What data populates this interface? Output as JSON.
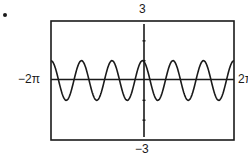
{
  "labels": {
    "y_max": "3",
    "y_min": "−3",
    "x_min": "−2π",
    "x_max": "2π"
  },
  "chart_data": {
    "type": "line",
    "title": "",
    "function": "y = cos(3x)",
    "xlabel": "",
    "ylabel": "",
    "xlim": [
      -6.2832,
      6.2832
    ],
    "ylim": [
      -3,
      3
    ],
    "x_tick_labels": [
      "−2π",
      "2π"
    ],
    "y_tick_labels": [
      "3",
      "−3"
    ],
    "y_ticks": [
      -2,
      -1,
      1,
      2
    ],
    "grid": false,
    "legend": null,
    "series": [
      {
        "name": "cos(3x)",
        "amplitude": 1,
        "period": 2.0944,
        "x": [
          -6.2832,
          -5.236,
          -4.1888,
          -3.1416,
          -2.0944,
          -1.0472,
          0,
          1.0472,
          2.0944,
          3.1416,
          4.1888,
          5.236,
          6.2832
        ],
        "values": [
          1,
          -1,
          1,
          -1,
          1,
          -1,
          1,
          -1,
          1,
          -1,
          1,
          -1,
          1
        ]
      }
    ]
  },
  "colors": {
    "line": "#1a1a1a",
    "background": "#ffffff"
  }
}
